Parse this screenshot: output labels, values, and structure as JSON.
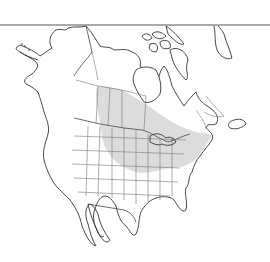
{
  "map": {
    "title": "",
    "region": "North America",
    "colors": {
      "background": "#ffffff",
      "land": "#ffffff",
      "outline": "#333333",
      "border": "#777777",
      "range_fill": "#d8d8d8"
    },
    "layers": [
      {
        "name": "coastline",
        "description": "North America coastline incl. Alaska, Canadian Arctic islands, Greenland edge"
      },
      {
        "name": "political-boundaries",
        "description": "US states and Canadian provinces"
      },
      {
        "name": "distribution-range",
        "description": "Shaded gray species range across Canadian prairies/boreal to eastern US"
      }
    ]
  }
}
